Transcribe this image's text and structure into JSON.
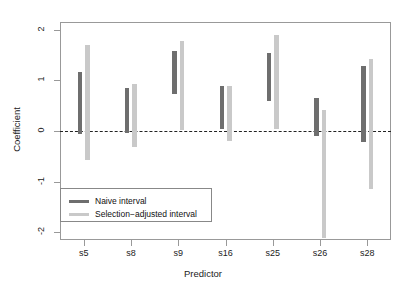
{
  "chart_data": {
    "type": "bar",
    "title": "",
    "xlabel": "Predictor",
    "ylabel": "Coefficient",
    "categories": [
      "s5",
      "s8",
      "s9",
      "s16",
      "s25",
      "s26",
      "s28"
    ],
    "ylim": [
      -2.15,
      2.15
    ],
    "yticks": [
      -2,
      -1,
      0,
      1,
      2
    ],
    "ytick_labels": [
      "-2",
      "-1",
      "0",
      "1",
      "2"
    ],
    "grid": false,
    "reference_line": 0,
    "legend_position": "bottom-left",
    "series": [
      {
        "name": "Naive interval",
        "color": "#6e6e6e",
        "type": "interval",
        "intervals": [
          {
            "category": "s5",
            "low": -0.06,
            "high": 1.16
          },
          {
            "category": "s8",
            "low": -0.03,
            "high": 0.85
          },
          {
            "category": "s9",
            "low": 0.72,
            "high": 1.58
          },
          {
            "category": "s16",
            "low": 0.04,
            "high": 0.88
          },
          {
            "category": "s25",
            "low": 0.6,
            "high": 1.53
          },
          {
            "category": "s26",
            "low": -0.1,
            "high": 0.66
          },
          {
            "category": "s28",
            "low": -0.22,
            "high": 1.28
          }
        ]
      },
      {
        "name": "Selection−adjusted interval",
        "color": "#c9c9c9",
        "type": "interval",
        "intervals": [
          {
            "category": "s5",
            "low": -0.57,
            "high": 1.7
          },
          {
            "category": "s8",
            "low": -0.31,
            "high": 0.93
          },
          {
            "category": "s9",
            "low": 0.02,
            "high": 1.77
          },
          {
            "category": "s16",
            "low": -0.19,
            "high": 0.88
          },
          {
            "category": "s25",
            "low": 0.03,
            "high": 1.9
          },
          {
            "category": "s26",
            "low": -2.12,
            "high": 0.42
          },
          {
            "category": "s28",
            "low": -1.15,
            "high": 1.42
          }
        ]
      }
    ]
  },
  "legend": {
    "items": [
      {
        "label": "Naive interval",
        "color": "#6e6e6e"
      },
      {
        "label": "Selection−adjusted interval",
        "color": "#c9c9c9"
      }
    ]
  }
}
